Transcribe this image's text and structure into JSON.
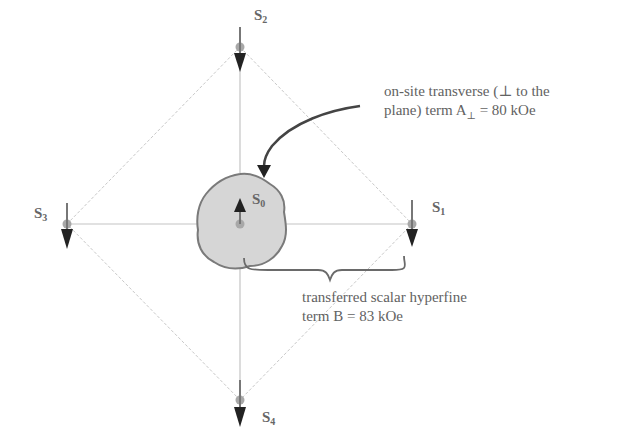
{
  "diagram": {
    "sites": [
      {
        "id": "S0",
        "label": "S",
        "sub": "0",
        "spin": "up",
        "x": 240,
        "y": 224
      },
      {
        "id": "S1",
        "label": "S",
        "sub": "1",
        "spin": "down",
        "x": 412,
        "y": 224
      },
      {
        "id": "S2",
        "label": "S",
        "sub": "2",
        "spin": "down",
        "x": 240,
        "y": 47
      },
      {
        "id": "S3",
        "label": "S",
        "sub": "3",
        "spin": "down",
        "x": 67,
        "y": 224
      },
      {
        "id": "S4",
        "label": "S",
        "sub": "4",
        "spin": "down",
        "x": 240,
        "y": 400
      }
    ],
    "annotations": {
      "transverse": {
        "line1": "on-site transverse (⊥ to the",
        "line2_prefix": "plane) term A",
        "line2_sub": "⊥",
        "line2_suffix": " = 80 kOe"
      },
      "scalar": {
        "line1": "transferred  scalar hyperfine",
        "line2": "term B = 83 kOe"
      }
    },
    "colors": {
      "grid_line": "#c8c8c8",
      "site_dot": "#a8a8a8",
      "arrow": "#222222",
      "blob_fill": "#d6d6d6",
      "blob_stroke": "#7a7a7a",
      "text": "#606060"
    }
  }
}
